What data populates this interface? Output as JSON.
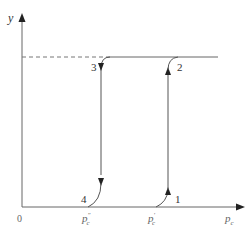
{
  "diagram": {
    "type": "hysteresis-loop",
    "axes": {
      "x_label": "p_c",
      "y_label": "y",
      "origin_label": "0"
    },
    "x_ticks": [
      {
        "label": "p_c\"",
        "base": "p",
        "sub": "c",
        "sup": "″"
      },
      {
        "label": "p_c'",
        "base": "p",
        "sub": "c",
        "sup": "′"
      }
    ],
    "points": [
      {
        "id": "1",
        "label": "1"
      },
      {
        "id": "2",
        "label": "2"
      },
      {
        "id": "3",
        "label": "3"
      },
      {
        "id": "4",
        "label": "4"
      }
    ],
    "saturation_line": {
      "style": "dashed-then-solid"
    },
    "paths": [
      {
        "from": "1",
        "to": "2",
        "direction": "up",
        "at": "p_c'"
      },
      {
        "from": "3",
        "to": "4",
        "direction": "down",
        "at": "p_c\""
      }
    ],
    "colors": {
      "line": "#555555",
      "dashed": "#777777",
      "text": "#333333"
    }
  }
}
